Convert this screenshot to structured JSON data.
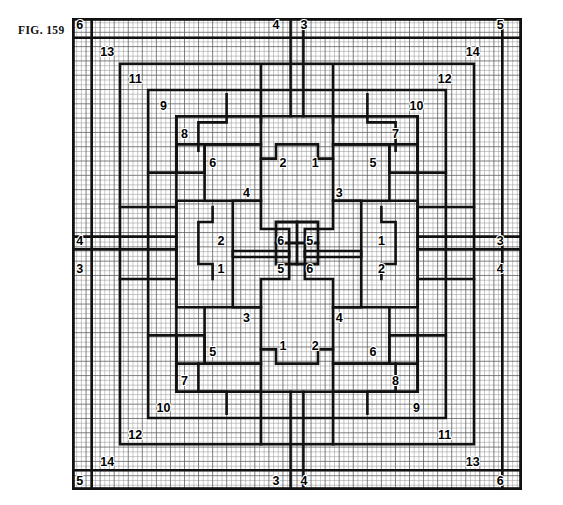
{
  "figure": {
    "label": "FIG. 159",
    "title": "FIG. 159",
    "type": "quilt-block-grid-diagram"
  },
  "grid": {
    "columns": 32,
    "rows": 33,
    "cell_px": 14.1,
    "minor_line_color": "#8a8a8a",
    "major_line_color": "#1a1a1a",
    "background": "#ffffff",
    "path_stroke_color": "#111111"
  },
  "labels": {
    "top_edge": [
      "6",
      "4",
      "3",
      "5"
    ],
    "bottom_edge": [
      "5",
      "3",
      "4",
      "6"
    ],
    "left_edge": [
      "4",
      "3"
    ],
    "right_edge": [
      "3",
      "4"
    ],
    "upper_left_chain": [
      "6",
      "13",
      "11",
      "9",
      "8",
      "6",
      "4",
      "2",
      "1"
    ],
    "upper_right_chain": [
      "5",
      "14",
      "12",
      "10",
      "7",
      "5",
      "3",
      "1"
    ],
    "lower_left_chain": [
      "5",
      "14",
      "12",
      "10",
      "7",
      "5",
      "3",
      "1"
    ],
    "lower_right_chain": [
      "6",
      "13",
      "11",
      "9",
      "8",
      "6",
      "4",
      "2"
    ],
    "center": [
      "6",
      "5",
      "5",
      "6"
    ]
  },
  "markers": [
    {
      "name": "corner-top-left",
      "text": "6",
      "col": 0.55,
      "row": 0.55
    },
    {
      "name": "top-center-left",
      "text": "4",
      "col": 14.5,
      "row": 0.55
    },
    {
      "name": "top-center-right",
      "text": "3",
      "col": 16.5,
      "row": 0.55
    },
    {
      "name": "corner-top-right",
      "text": "5",
      "col": 30.45,
      "row": 0.55
    },
    {
      "name": "ring-13-top-left",
      "text": "13",
      "col": 2.5,
      "row": 2.4
    },
    {
      "name": "ring-14-top-right",
      "text": "14",
      "col": 28.5,
      "row": 2.4
    },
    {
      "name": "ring-11-top-left",
      "text": "11",
      "col": 4.5,
      "row": 4.3
    },
    {
      "name": "ring-12-top-right",
      "text": "12",
      "col": 26.5,
      "row": 4.3
    },
    {
      "name": "ring-9-top-left",
      "text": "9",
      "col": 6.5,
      "row": 6.2
    },
    {
      "name": "ring-10-top-right",
      "text": "10",
      "col": 24.5,
      "row": 6.2
    },
    {
      "name": "ring-8-top-left",
      "text": "8",
      "col": 8.0,
      "row": 8.15
    },
    {
      "name": "ring-7-top-right",
      "text": "7",
      "col": 23.0,
      "row": 8.15
    },
    {
      "name": "block-6-upper-left",
      "text": "6",
      "col": 10.0,
      "row": 10.2
    },
    {
      "name": "block-5-upper-right",
      "text": "5",
      "col": 21.4,
      "row": 10.2
    },
    {
      "name": "block-2-upper-center",
      "text": "2",
      "col": 15.0,
      "row": 10.2
    },
    {
      "name": "block-1-upper-center",
      "text": "1",
      "col": 17.3,
      "row": 10.2
    },
    {
      "name": "block-4-upper-left",
      "text": "4",
      "col": 12.4,
      "row": 12.25
    },
    {
      "name": "block-3-upper-right",
      "text": "3",
      "col": 19.0,
      "row": 12.25
    },
    {
      "name": "left-edge-4",
      "text": "4",
      "col": 0.55,
      "row": 15.65
    },
    {
      "name": "left-edge-3",
      "text": "3",
      "col": 0.55,
      "row": 17.6
    },
    {
      "name": "right-edge-3",
      "text": "3",
      "col": 30.45,
      "row": 15.65
    },
    {
      "name": "right-edge-4",
      "text": "4",
      "col": 30.45,
      "row": 17.6
    },
    {
      "name": "block-2-mid-left",
      "text": "2",
      "col": 10.6,
      "row": 15.65
    },
    {
      "name": "block-1-mid-left",
      "text": "1",
      "col": 10.6,
      "row": 17.6
    },
    {
      "name": "block-1-mid-right",
      "text": "1",
      "col": 22.0,
      "row": 15.65
    },
    {
      "name": "block-2-mid-right",
      "text": "2",
      "col": 22.0,
      "row": 17.6
    },
    {
      "name": "center-6-top-left",
      "text": "6",
      "col": 14.85,
      "row": 15.65
    },
    {
      "name": "center-5-top-right",
      "text": "5",
      "col": 16.9,
      "row": 15.65
    },
    {
      "name": "center-5-bot-left",
      "text": "5",
      "col": 14.85,
      "row": 17.6
    },
    {
      "name": "center-6-bot-right",
      "text": "6",
      "col": 16.9,
      "row": 17.6
    },
    {
      "name": "block-3-lower-left",
      "text": "3",
      "col": 12.4,
      "row": 21.0
    },
    {
      "name": "block-4-lower-right",
      "text": "4",
      "col": 19.0,
      "row": 21.0
    },
    {
      "name": "block-1-lower-center",
      "text": "1",
      "col": 15.0,
      "row": 23.0
    },
    {
      "name": "block-2-lower-center",
      "text": "2",
      "col": 17.3,
      "row": 23.0
    },
    {
      "name": "block-5-lower-left",
      "text": "5",
      "col": 10.0,
      "row": 23.4
    },
    {
      "name": "block-6-lower-right",
      "text": "6",
      "col": 21.4,
      "row": 23.4
    },
    {
      "name": "ring-7-bottom-left",
      "text": "7",
      "col": 8.0,
      "row": 25.4
    },
    {
      "name": "ring-8-bottom-right",
      "text": "8",
      "col": 23.0,
      "row": 25.4
    },
    {
      "name": "ring-10-bottom-left",
      "text": "10",
      "col": 6.5,
      "row": 27.3
    },
    {
      "name": "ring-9-bottom-right",
      "text": "9",
      "col": 24.5,
      "row": 27.3
    },
    {
      "name": "ring-12-bottom-left",
      "text": "12",
      "col": 4.5,
      "row": 29.2
    },
    {
      "name": "ring-11-bottom-right",
      "text": "11",
      "col": 26.5,
      "row": 29.2
    },
    {
      "name": "ring-14-bottom-left",
      "text": "14",
      "col": 2.5,
      "row": 31.1
    },
    {
      "name": "ring-13-bottom-right",
      "text": "13",
      "col": 28.5,
      "row": 31.1
    },
    {
      "name": "corner-bottom-left",
      "text": "5",
      "col": 0.55,
      "row": 32.45
    },
    {
      "name": "bottom-center-left",
      "text": "3",
      "col": 14.5,
      "row": 32.45
    },
    {
      "name": "bottom-center-right",
      "text": "4",
      "col": 16.5,
      "row": 32.45
    },
    {
      "name": "corner-bottom-right",
      "text": "6",
      "col": 30.45,
      "row": 32.45
    }
  ],
  "paths": {
    "description": "Nested concentric stepped outlines forming a symmetric quilt block, plus a central pinwheel motif.",
    "outer_border": "0,0 32,0 32,33 0,33 z",
    "rings": [
      "1.4,1.4 H30.6 V31.6 H1.4 Z",
      "3.4,3.0 H28.6 V29.9 H3.4 Z",
      "5.4,4.9 H26.6 V28.0 H5.4 Z",
      "7.4,6.8 H24.6 V26.1 H7.4 Z"
    ]
  }
}
